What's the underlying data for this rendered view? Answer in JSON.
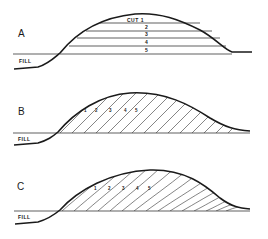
{
  "diagram": {
    "colors": {
      "ink": "#1a1a1a",
      "background": "#ffffff",
      "hatch": "#333333"
    },
    "panels": [
      {
        "id": "A",
        "label": "A",
        "fill_label": "FILL",
        "method": "horizontal layers",
        "cut_labels": [
          "CUT 1",
          "2",
          "3",
          "4",
          "5"
        ]
      },
      {
        "id": "B",
        "label": "B",
        "fill_label": "FILL",
        "method": "inclined straight slices",
        "cut_labels": [
          "1",
          "2",
          "3",
          "4",
          "5"
        ]
      },
      {
        "id": "C",
        "label": "C",
        "fill_label": "FILL",
        "method": "inclined curved slices",
        "cut_labels": [
          "1",
          "2",
          "3",
          "4",
          "5"
        ]
      }
    ]
  }
}
